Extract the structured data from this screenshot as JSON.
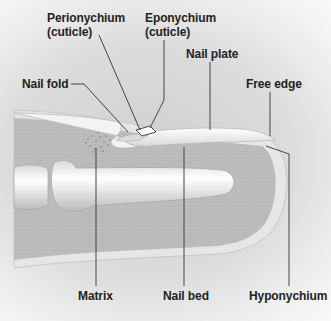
{
  "diagram": {
    "labels": {
      "perionychium": {
        "line1": "Perionychium",
        "line2": "(cuticle)"
      },
      "eponychium": {
        "line1": "Eponychium",
        "line2": "(cuticle)"
      },
      "nail_plate": "Nail plate",
      "nail_fold": "Nail fold",
      "free_edge": "Free edge",
      "matrix": "Matrix",
      "nail_bed": "Nail bed",
      "hyponychium": "Hyponychium"
    },
    "colors": {
      "skin": "#bdbdbd",
      "skin_edge": "#e8e8e8",
      "bone": "#f2f2f2",
      "nail": "#f5f5f5",
      "leader_line": "#333333",
      "text": "#222222"
    }
  }
}
